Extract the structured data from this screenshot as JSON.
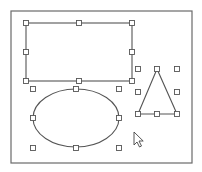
{
  "canvas": {
    "width": 202,
    "height": 172,
    "background": "#ffffff",
    "stroke_color": "#555555",
    "handle_fill": "#ffffff",
    "handle_size": 5
  },
  "frame": {
    "x": 11,
    "y": 11,
    "width": 181,
    "height": 152,
    "stroke": "#6a6a6a"
  },
  "shapes": {
    "rectangle": {
      "x": 26,
      "y": 23,
      "width": 106,
      "height": 58,
      "handles": [
        [
          26,
          23
        ],
        [
          79,
          23
        ],
        [
          132,
          23
        ],
        [
          26,
          52
        ],
        [
          132,
          52
        ],
        [
          26,
          81
        ],
        [
          79,
          81
        ],
        [
          132,
          81
        ]
      ]
    },
    "ellipse": {
      "cx": 76,
      "cy": 118,
      "rx": 43,
      "ry": 29,
      "handles": [
        [
          33,
          89
        ],
        [
          76,
          89
        ],
        [
          119,
          89
        ],
        [
          33,
          118
        ],
        [
          119,
          118
        ],
        [
          33,
          148
        ],
        [
          76,
          148
        ],
        [
          119,
          148
        ]
      ]
    },
    "triangle": {
      "points": [
        [
          157,
          69
        ],
        [
          138,
          114
        ],
        [
          177,
          114
        ]
      ],
      "handles": [
        [
          138,
          69
        ],
        [
          157,
          69
        ],
        [
          177,
          69
        ],
        [
          138,
          92
        ],
        [
          177,
          92
        ],
        [
          138,
          114
        ],
        [
          157,
          114
        ],
        [
          177,
          114
        ]
      ]
    }
  },
  "cursor": {
    "type": "arrow-pointer",
    "x": 134,
    "y": 132
  }
}
